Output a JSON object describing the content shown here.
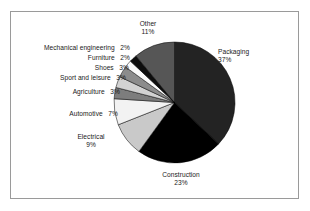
{
  "figure": {
    "background": "#ffffff",
    "frame_color": "#9a9a9a"
  },
  "chart_data": {
    "type": "pie",
    "title": "",
    "subtitle": "",
    "xlabel": "",
    "ylabel": "",
    "legend_position": "none",
    "grid": false,
    "units": "percent",
    "start_angle_deg": 0,
    "direction": "clockwise",
    "categories": [
      "Packaging",
      "Construction",
      "Electrical",
      "Automotive",
      "Agriculture",
      "Sport and leisure",
      "Shoes",
      "Furniture",
      "Mechanical engineering",
      "Other"
    ],
    "values": [
      37,
      23,
      9,
      7,
      3,
      3,
      3,
      2,
      2,
      11
    ],
    "labels": [
      "Packaging",
      "Construction",
      "Electrical",
      "Automotive",
      "Agriculture",
      "Sport and leisure",
      "Shoes",
      "Furniture",
      "Mechanical engineering",
      "Other"
    ],
    "value_labels": [
      "37%",
      "23%",
      "9%",
      "7%",
      "3%",
      "3%",
      "3%",
      "2%",
      "2%",
      "11%"
    ],
    "colors": [
      "#232323",
      "#000000",
      "#c9c9c9",
      "#f2f2f2",
      "#7d7d7d",
      "#d2d2d2",
      "#8c8c8c",
      "#fafafa",
      "#0d0d0d",
      "#565656"
    ],
    "slice_edge_color": "#000000",
    "slices": [
      {
        "name": "Packaging",
        "value": 37,
        "value_label": "37%",
        "color": "#232323"
      },
      {
        "name": "Construction",
        "value": 23,
        "value_label": "23%",
        "color": "#000000"
      },
      {
        "name": "Electrical",
        "value": 9,
        "value_label": "9%",
        "color": "#c9c9c9"
      },
      {
        "name": "Automotive",
        "value": 7,
        "value_label": "7%",
        "color": "#f2f2f2"
      },
      {
        "name": "Agriculture",
        "value": 3,
        "value_label": "3%",
        "color": "#7d7d7d"
      },
      {
        "name": "Sport and leisure",
        "value": 3,
        "value_label": "3%",
        "color": "#d2d2d2"
      },
      {
        "name": "Shoes",
        "value": 3,
        "value_label": "3%",
        "color": "#8c8c8c"
      },
      {
        "name": "Furniture",
        "value": 2,
        "value_label": "2%",
        "color": "#fafafa"
      },
      {
        "name": "Mechanical engineering",
        "value": 2,
        "value_label": "2%",
        "color": "#0d0d0d"
      },
      {
        "name": "Other",
        "value": 11,
        "value_label": "11%",
        "color": "#565656"
      }
    ]
  },
  "annotations": {
    "packaging": {
      "name": "Packaging",
      "pct": "37%"
    },
    "construction": {
      "name": "Construction",
      "pct": "23%"
    },
    "electrical": {
      "name": "Electrical",
      "pct": "9%"
    },
    "automotive": {
      "name": "Automotive",
      "pct": "7%"
    },
    "agriculture": {
      "name": "Agriculture",
      "pct": "3%"
    },
    "sport": {
      "name": "Sport and leisure",
      "pct": "3%"
    },
    "shoes": {
      "name": "Shoes",
      "pct": "3%"
    },
    "furniture": {
      "name": "Furniture",
      "pct": "2%"
    },
    "mechanical": {
      "name": "Mechanical engineering",
      "pct": "2%"
    },
    "other": {
      "name": "Other",
      "pct": "11%"
    }
  }
}
